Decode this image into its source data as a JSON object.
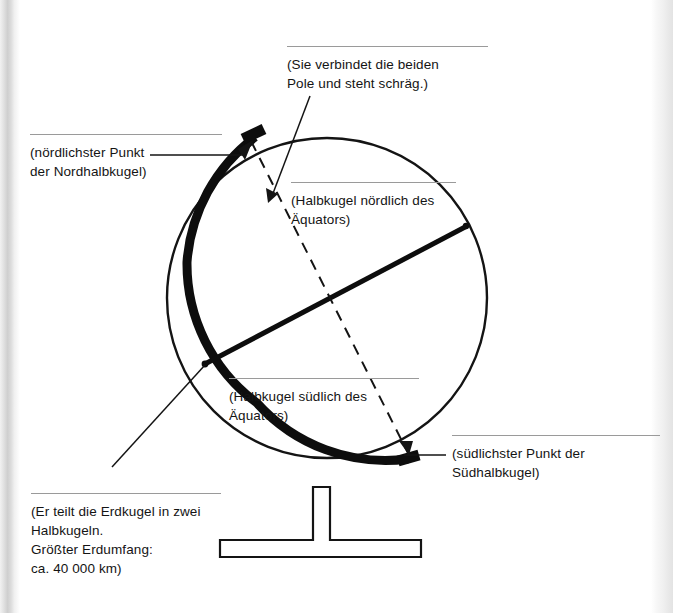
{
  "figure": {
    "kind": "globe-diagram",
    "colors": {
      "ink": "#141414",
      "rule": "#9a9a9a",
      "page": "#ffffff"
    },
    "annotations": [
      {
        "id": "north-pole",
        "lines": [
          "(nördlichster Punkt",
          "der Nordhalbkugel)"
        ],
        "target": "north-pole-point"
      },
      {
        "id": "axis",
        "lines": [
          "(Sie verbindet die beiden",
          "Pole und steht schräg.)"
        ],
        "target": "earth-axis"
      },
      {
        "id": "northern-hemisphere",
        "lines": [
          "(Halbkugel nördlich des",
          "Äquators)"
        ],
        "target": "northern-hemisphere-area"
      },
      {
        "id": "southern-hemisphere",
        "lines": [
          "(Halbkugel südlich des",
          "Äquators)"
        ],
        "target": "southern-hemisphere-area"
      },
      {
        "id": "south-pole",
        "lines": [
          "(südlichster Punkt der",
          "Südhalbkugel)"
        ],
        "target": "south-pole-point"
      },
      {
        "id": "equator",
        "lines": [
          "(Er teilt die Erdkugel in zwei",
          "Halbkugeln.",
          "Größter Erdumfang:",
          "ca. 40 000 km)"
        ],
        "target": "equator-line"
      }
    ]
  }
}
